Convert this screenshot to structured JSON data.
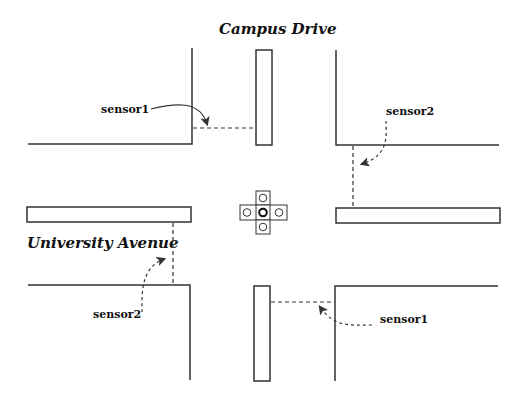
{
  "diagram": {
    "streets": [
      {
        "name": "Campus Drive"
      },
      {
        "name": "University Avenue"
      }
    ],
    "sensors": [
      {
        "label": "sensor1",
        "position": "top-left"
      },
      {
        "label": "sensor2",
        "position": "top-right"
      },
      {
        "label": "sensor2",
        "position": "bottom-left"
      },
      {
        "label": "sensor1",
        "position": "bottom-right"
      }
    ],
    "traffic_light": {
      "lamps": 5,
      "center_lamp": "active"
    },
    "colors": {
      "line": "#333333",
      "background": "#ffffff"
    }
  }
}
